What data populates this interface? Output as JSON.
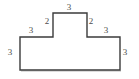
{
  "figure": {
    "kind": "polygon-with-edge-lengths",
    "background_color": "#ffffff",
    "stroke_color": "#3b3b3b",
    "stroke_width": 1.4,
    "label_color": "#4d4d4d",
    "outline_points": "20,70 20,37 53,37 53,13 87,13 87,37 120,37 120,70",
    "labels": {
      "top": "3",
      "left_riser": "2",
      "right_riser": "2",
      "left_shoulder": "3",
      "right_shoulder": "3",
      "left_side": "3",
      "right_side": "3"
    }
  },
  "chart_data": {
    "type": "diagram",
    "title": "",
    "shape": "T-shaped polygon",
    "vertices": [
      {
        "x": 20,
        "y": 70
      },
      {
        "x": 20,
        "y": 37
      },
      {
        "x": 53,
        "y": 37
      },
      {
        "x": 53,
        "y": 13
      },
      {
        "x": 87,
        "y": 13
      },
      {
        "x": 87,
        "y": 37
      },
      {
        "x": 120,
        "y": 37
      },
      {
        "x": 120,
        "y": 70
      }
    ],
    "edge_lengths": [
      3,
      3,
      2,
      3,
      2,
      3,
      3
    ],
    "edge_labels": [
      "3",
      "3",
      "2",
      "3",
      "2",
      "3",
      "3"
    ]
  }
}
